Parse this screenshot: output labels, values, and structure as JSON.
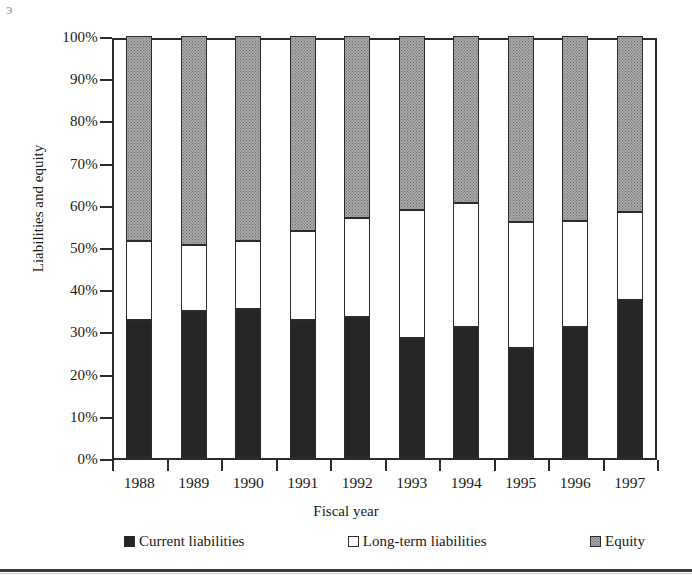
{
  "figure": {
    "artifact_glyph": "э"
  },
  "axes": {
    "y_title": "Liabilities and equity",
    "x_title": "Fiscal year",
    "y_ticks": [
      "100%",
      "90%",
      "80%",
      "70%",
      "60%",
      "50%",
      "40%",
      "30%",
      "20%",
      "10%",
      "0%"
    ]
  },
  "legend": {
    "items": [
      {
        "label": "Current liabilities",
        "swatch": "filled-black-square-icon",
        "color": "#262626"
      },
      {
        "label": "Long-term liabilities",
        "swatch": "outlined-white-square-icon",
        "color": "#ffffff"
      },
      {
        "label": "Equity",
        "swatch": "stippled-gray-square-icon",
        "color": "#a8a8a8"
      }
    ]
  },
  "chart_data": {
    "type": "bar",
    "subtype": "stacked-100-percent",
    "title": "",
    "xlabel": "Fiscal year",
    "ylabel": "Liabilities and equity",
    "ylim": [
      0,
      100
    ],
    "ytick_values": [
      0,
      10,
      20,
      30,
      40,
      50,
      60,
      70,
      80,
      90,
      100
    ],
    "ytick_labels": [
      "0%",
      "10%",
      "20%",
      "30%",
      "40%",
      "50%",
      "60%",
      "70%",
      "80%",
      "90%",
      "100%"
    ],
    "grid": false,
    "legend_position": "bottom",
    "categories": [
      "1988",
      "1989",
      "1990",
      "1991",
      "1992",
      "1993",
      "1994",
      "1995",
      "1996",
      "1997"
    ],
    "series": [
      {
        "name": "Current liabilities",
        "color": "#262626",
        "values": [
          32.7,
          34.8,
          35.3,
          32.7,
          33.4,
          28.4,
          31.0,
          26.1,
          31.0,
          37.4
        ]
      },
      {
        "name": "Long-term liabilities",
        "color": "#ffffff",
        "values": [
          18.7,
          15.7,
          16.1,
          21.1,
          23.5,
          30.4,
          29.4,
          29.8,
          25.2,
          20.9
        ]
      },
      {
        "name": "Equity",
        "color": "#a8a8a8",
        "values": [
          48.6,
          49.5,
          48.6,
          46.2,
          43.1,
          41.2,
          39.6,
          44.1,
          43.8,
          41.7
        ]
      }
    ],
    "cumulative_tops": {
      "current_liabilities": [
        32.7,
        34.8,
        35.3,
        32.7,
        33.4,
        28.4,
        31.0,
        26.1,
        31.0,
        37.4
      ],
      "liabilities_total": [
        51.4,
        50.5,
        51.4,
        53.8,
        56.9,
        58.8,
        60.4,
        55.9,
        56.2,
        58.3
      ]
    }
  }
}
